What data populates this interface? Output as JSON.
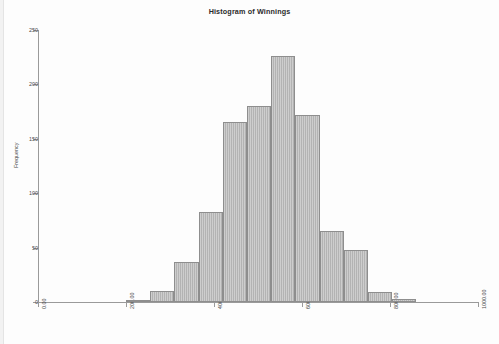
{
  "chart_data": {
    "type": "bar",
    "title": "Histogram of Winnings",
    "xlabel": "",
    "ylabel": "Frequency",
    "xlim": [
      0,
      1000
    ],
    "ylim": [
      0,
      250
    ],
    "grid": false,
    "legend": null,
    "bin_width": 55,
    "bin_starts": [
      200,
      255,
      310,
      365,
      420,
      475,
      530,
      585,
      640,
      695,
      750,
      805
    ],
    "bin_ends": [
      255,
      310,
      365,
      420,
      475,
      530,
      585,
      640,
      695,
      750,
      805,
      860
    ],
    "categories": [
      "200-255",
      "255-310",
      "310-365",
      "365-420",
      "420-475",
      "475-530",
      "530-585",
      "585-640",
      "640-695",
      "695-750",
      "750-805",
      "805-860"
    ],
    "values": [
      2,
      10,
      37,
      83,
      165,
      180,
      226,
      172,
      65,
      48,
      9,
      3
    ],
    "y_ticks": [
      0,
      50,
      100,
      150,
      200,
      250
    ],
    "y_tick_labels": [
      "0",
      "50",
      "100",
      "150",
      "200",
      "250"
    ],
    "x_ticks": [
      0,
      200,
      400,
      600,
      800,
      1000
    ],
    "x_tick_labels": [
      "0.00",
      "200.00",
      "400.00",
      "600.00",
      "800.00",
      "1000.00"
    ],
    "bar_color": "#b3b3b3",
    "bar_edge_color": "#8e8e8e",
    "axis_color": "#9a9a9a",
    "text_color": "#4a4a4a",
    "background": "#ffffff"
  }
}
